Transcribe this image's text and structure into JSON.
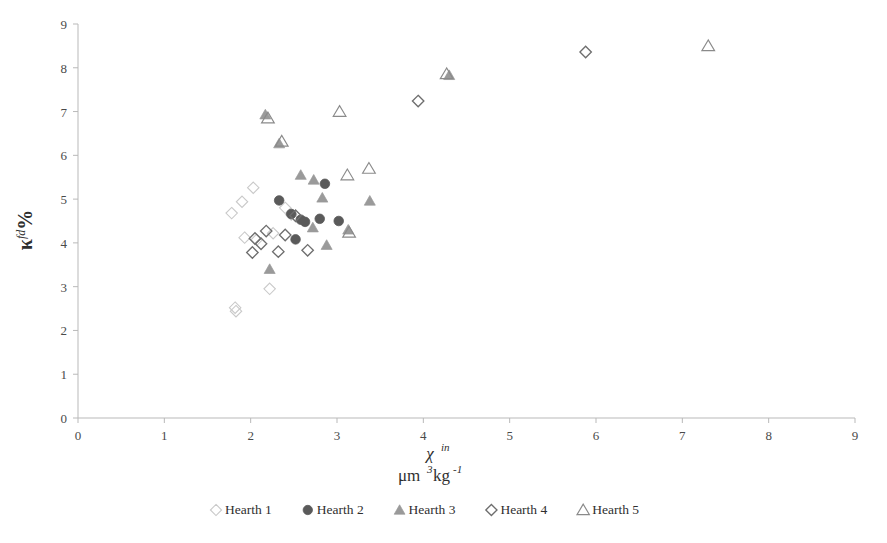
{
  "chart_data": {
    "type": "scatter",
    "title": "",
    "xlabel": "χ in μm3kg-1",
    "ylabel": "κ fd %",
    "xlabel_symbol": "χ",
    "xlabel_symbol_sup": "in",
    "xlabel_unit_base": "μm",
    "xlabel_unit_sup1": "3",
    "xlabel_unit_mid": "kg",
    "xlabel_unit_sup2": "-1",
    "ylabel_symbol": "κ",
    "ylabel_symbol_sup": "fd",
    "ylabel_symbol_tail": "%",
    "xlim": [
      0,
      9
    ],
    "ylim": [
      0,
      9
    ],
    "xticks": [
      "0",
      "1",
      "2",
      "3",
      "4",
      "5",
      "6",
      "7",
      "8",
      "9"
    ],
    "yticks": [
      "0",
      "1",
      "2",
      "3",
      "4",
      "5",
      "6",
      "7",
      "8",
      "9"
    ],
    "grid": false,
    "legend_position": "bottom",
    "series": [
      {
        "name": "Hearth 1",
        "marker": "diamond-open",
        "color": "#c9c9c9",
        "points": [
          [
            1.78,
            4.68
          ],
          [
            1.9,
            4.94
          ],
          [
            2.03,
            5.26
          ],
          [
            1.93,
            4.12
          ],
          [
            2.07,
            4.07
          ],
          [
            2.26,
            4.22
          ],
          [
            2.4,
            4.8
          ],
          [
            2.47,
            4.65
          ],
          [
            1.82,
            2.52
          ],
          [
            1.83,
            2.44
          ],
          [
            2.22,
            2.95
          ]
        ]
      },
      {
        "name": "Hearth 2",
        "marker": "circle-filled",
        "color": "#5a5a5a",
        "points": [
          [
            2.33,
            4.97
          ],
          [
            2.86,
            5.35
          ],
          [
            2.47,
            4.66
          ],
          [
            2.58,
            4.53
          ],
          [
            2.63,
            4.48
          ],
          [
            2.8,
            4.55
          ],
          [
            2.52,
            4.08
          ],
          [
            3.02,
            4.5
          ]
        ]
      },
      {
        "name": "Hearth 3",
        "marker": "triangle-filled",
        "color": "#9a9a9a",
        "points": [
          [
            2.17,
            6.93
          ],
          [
            2.33,
            6.27
          ],
          [
            2.58,
            5.55
          ],
          [
            2.73,
            5.44
          ],
          [
            2.83,
            5.03
          ],
          [
            3.38,
            4.96
          ],
          [
            2.72,
            4.35
          ],
          [
            3.13,
            4.3
          ],
          [
            2.88,
            3.95
          ],
          [
            2.22,
            3.4
          ],
          [
            4.3,
            7.83
          ]
        ]
      },
      {
        "name": "Hearth 4",
        "marker": "diamond-open-dark",
        "color": "#6e6e6e",
        "points": [
          [
            2.18,
            4.27
          ],
          [
            2.05,
            4.1
          ],
          [
            2.4,
            4.18
          ],
          [
            2.12,
            3.98
          ],
          [
            2.02,
            3.78
          ],
          [
            2.32,
            3.8
          ],
          [
            2.52,
            4.62
          ],
          [
            2.66,
            3.83
          ],
          [
            3.94,
            7.24
          ],
          [
            5.88,
            8.36
          ]
        ]
      },
      {
        "name": "Hearth 5",
        "marker": "triangle-open",
        "color": "#8a8a8a",
        "points": [
          [
            2.2,
            6.85
          ],
          [
            2.36,
            6.32
          ],
          [
            3.03,
            7.0
          ],
          [
            3.12,
            5.55
          ],
          [
            3.37,
            5.7
          ],
          [
            3.14,
            4.24
          ],
          [
            4.27,
            7.86
          ],
          [
            7.3,
            8.5
          ]
        ]
      }
    ]
  },
  "legend": {
    "items": [
      {
        "label": "Hearth 1",
        "marker": "diamond-open",
        "color": "#c9c9c9"
      },
      {
        "label": "Hearth 2",
        "marker": "circle-filled",
        "color": "#5a5a5a"
      },
      {
        "label": "Hearth 3",
        "marker": "triangle-filled",
        "color": "#9a9a9a"
      },
      {
        "label": "Hearth 4",
        "marker": "diamond-open-dark",
        "color": "#6e6e6e"
      },
      {
        "label": "Hearth 5",
        "marker": "triangle-open",
        "color": "#8a8a8a"
      }
    ]
  }
}
